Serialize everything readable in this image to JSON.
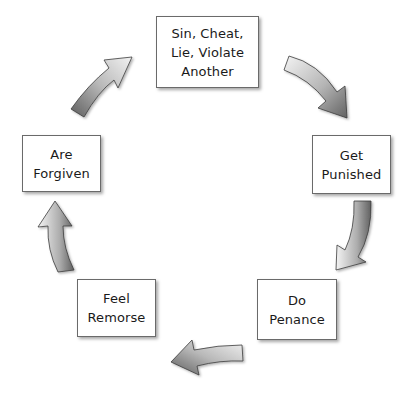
{
  "diagram": {
    "type": "cycle",
    "nodes": [
      {
        "id": "sin",
        "lines": [
          "Sin, Cheat,",
          "Lie, Violate",
          "Another"
        ]
      },
      {
        "id": "punished",
        "lines": [
          "Get",
          "Punished"
        ]
      },
      {
        "id": "penance",
        "lines": [
          "Do",
          "Penance"
        ]
      },
      {
        "id": "remorse",
        "lines": [
          "Feel",
          "Remorse"
        ]
      },
      {
        "id": "forgiven",
        "lines": [
          "Are",
          "Forgiven"
        ]
      }
    ],
    "edges": [
      {
        "from": "sin",
        "to": "punished",
        "direction": "clockwise"
      },
      {
        "from": "punished",
        "to": "penance",
        "direction": "clockwise"
      },
      {
        "from": "penance",
        "to": "remorse",
        "direction": "clockwise"
      },
      {
        "from": "remorse",
        "to": "forgiven",
        "direction": "clockwise"
      },
      {
        "from": "forgiven",
        "to": "sin",
        "direction": "clockwise"
      }
    ],
    "colors": {
      "box_border": "#6a6a6a",
      "text": "#1a1a1a",
      "arrow_light": "#f2f2f2",
      "arrow_dark": "#6e6e6e",
      "arrow_outline": "#3c3c3c"
    }
  }
}
